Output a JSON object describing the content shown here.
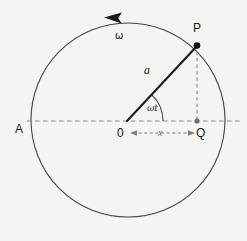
{
  "figure": {
    "name": "circular-motion-shm-projection",
    "width": 247,
    "height": 241,
    "background_color": "#f4f4f3",
    "stroke_color": "#2b2b2b",
    "dash_color": "#8a8a8a",
    "label_color": "#1a1a1a"
  },
  "labels": {
    "point_p": "P",
    "point_q": "Q",
    "point_a": "A",
    "origin": "0",
    "radius": "a",
    "angle": "ωt",
    "angular_velocity": "ω",
    "displacement": "x"
  },
  "geometry": {
    "circle": {
      "cx": 128,
      "cy": 120,
      "r": 97
    },
    "origin_point": {
      "x": 127,
      "y": 121
    },
    "point_p": {
      "x": 197,
      "y": 45
    },
    "point_q": {
      "x": 197,
      "y": 121
    },
    "point_a": {
      "x": 31,
      "y": 121
    },
    "angle_degrees": 47,
    "arc_marker_radius": 36,
    "rotation_direction": "counter-clockwise"
  },
  "label_positions": {
    "point_p": {
      "x": 193,
      "y": 22
    },
    "point_q": {
      "x": 196,
      "y": 127
    },
    "point_a": {
      "x": 15,
      "y": 123
    },
    "origin": {
      "x": 117,
      "y": 127
    },
    "radius": {
      "x": 144,
      "y": 64
    },
    "angle": {
      "x": 147,
      "y": 104
    },
    "angular_velocity": {
      "x": 115,
      "y": 31
    },
    "displacement": {
      "x": 158,
      "y": 128
    }
  }
}
